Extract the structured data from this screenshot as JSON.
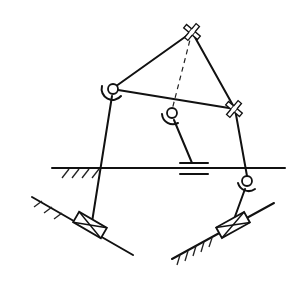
{
  "diagram": {
    "type": "planar linkage mechanism (kinematic diagram)",
    "colors": {
      "line": "#111111",
      "background": "#ffffff"
    },
    "joints": [
      {
        "id": "top",
        "kind": "cross-hinge",
        "x": 192,
        "y": 32
      },
      {
        "id": "left",
        "kind": "revolute-circle",
        "x": 112,
        "y": 89
      },
      {
        "id": "right",
        "kind": "cross-hinge",
        "x": 235,
        "y": 109
      },
      {
        "id": "middle",
        "kind": "revolute-circle",
        "x": 172,
        "y": 113
      },
      {
        "id": "lower-right",
        "kind": "revolute-circle",
        "x": 247,
        "y": 182
      }
    ],
    "ground": {
      "y": 168,
      "x1": 52,
      "x2": 285,
      "bearing_x": 192
    },
    "sliders": [
      {
        "id": "left-slider",
        "x": 90,
        "y": 225,
        "angle": 30
      },
      {
        "id": "right-slider",
        "x": 233,
        "y": 225,
        "angle": -30
      }
    ],
    "labels": []
  }
}
